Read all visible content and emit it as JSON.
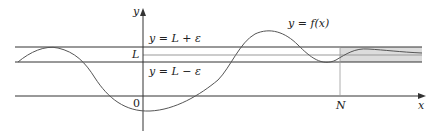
{
  "diagram": {
    "axis_labels": {
      "y": "y",
      "x": "x",
      "origin": "0"
    },
    "function_label": "y = f(x)",
    "upper_line_label": "y = L + ε",
    "lower_line_label": "y = L − ε",
    "L_label": "L",
    "N_label": "N",
    "colors": {
      "line": "#333333",
      "curve": "#555555",
      "shade": "#d9d9d9",
      "L_line": "#999999"
    }
  }
}
